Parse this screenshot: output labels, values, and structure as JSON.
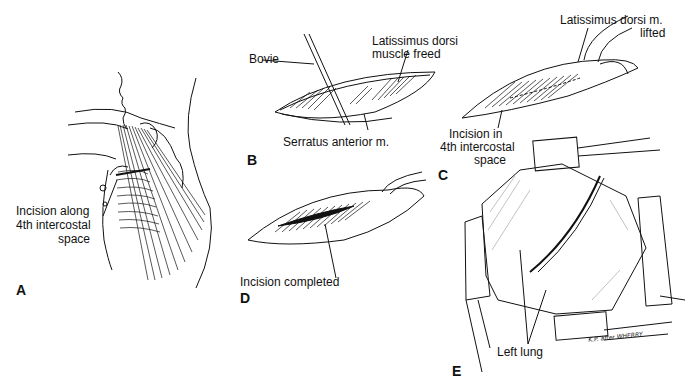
{
  "figure": {
    "panels": [
      {
        "id": "A",
        "letter": "A",
        "labels": [
          "Incision along",
          "4th intercostal",
          "space"
        ]
      },
      {
        "id": "B",
        "letter": "B",
        "labels": {
          "bovie": "Bovie",
          "latissimus_1": "Latissimus dorsi",
          "latissimus_2": "muscle freed",
          "serratus": "Serratus anterior m."
        }
      },
      {
        "id": "C",
        "letter": "C",
        "labels": {
          "latissimus_1": "Latissimus dorsi  m.",
          "latissimus_2": "lifted",
          "incision_1": "Incision in",
          "incision_2": "4th intercostal",
          "incision_3": "space"
        }
      },
      {
        "id": "D",
        "letter": "D",
        "labels": {
          "incision": "Incision completed"
        }
      },
      {
        "id": "E",
        "letter": "E",
        "labels": {
          "lung": "Left lung"
        },
        "signature": "K.P. after WHERRY"
      }
    ]
  }
}
